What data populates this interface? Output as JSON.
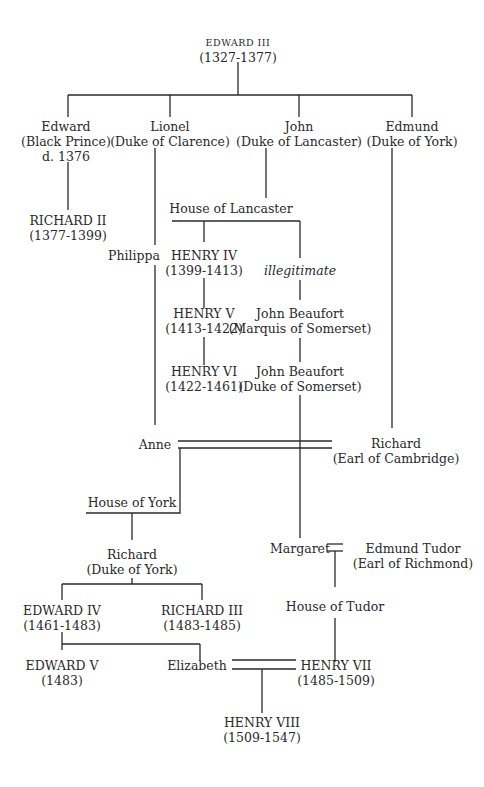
{
  "nodes": {
    "edward_iii": {
      "name": "EDWARD III",
      "sub": "(1327-1377)"
    },
    "edward_black_prince": {
      "name": "Edward",
      "sub": "(Black Prince)",
      "sub2": "d. 1376"
    },
    "lionel": {
      "name": "Lionel",
      "sub": "(Duke of Clarence)"
    },
    "john_lancaster": {
      "name": "John",
      "sub": "(Duke of Lancaster)"
    },
    "edmund_york": {
      "name": "Edmund",
      "sub": "(Duke of York)"
    },
    "richard_ii": {
      "name": "RICHARD II",
      "sub": "(1377-1399)"
    },
    "house_of_lancaster": {
      "name": "House of Lancaster"
    },
    "philippa": {
      "name": "Philippa"
    },
    "henry_iv": {
      "name": "HENRY IV",
      "sub": "(1399-1413)"
    },
    "illegitimate": {
      "name": "illegitimate"
    },
    "henry_v": {
      "name": "HENRY V",
      "sub": "(1413-1422)"
    },
    "john_beaufort_marquis": {
      "name": "John Beaufort",
      "sub": "(Marquis of Somerset)"
    },
    "henry_vi": {
      "name": "HENRY VI",
      "sub": "(1422-1461)"
    },
    "john_beaufort_duke": {
      "name": "John Beaufort",
      "sub": "(Duke of Somerset)"
    },
    "anne": {
      "name": "Anne"
    },
    "richard_cambridge": {
      "name": "Richard",
      "sub": "(Earl of Cambridge)"
    },
    "house_of_york": {
      "name": "House of York"
    },
    "richard_york": {
      "name": "Richard",
      "sub": "(Duke of York)"
    },
    "margaret": {
      "name": "Margaret"
    },
    "edmund_tudor": {
      "name": "Edmund Tudor",
      "sub": "(Earl of Richmond)"
    },
    "house_of_tudor": {
      "name": "House of Tudor"
    },
    "edward_iv": {
      "name": "EDWARD IV",
      "sub": "(1461-1483)"
    },
    "richard_iii": {
      "name": "RICHARD III",
      "sub": "(1483-1485)"
    },
    "edward_v": {
      "name": "EDWARD V",
      "sub": "(1483)"
    },
    "elizabeth": {
      "name": "Elizabeth"
    },
    "henry_vii": {
      "name": "HENRY VII",
      "sub": "(1485-1509)"
    },
    "henry_viii": {
      "name": "HENRY VIII",
      "sub": "(1509-1547)"
    }
  }
}
